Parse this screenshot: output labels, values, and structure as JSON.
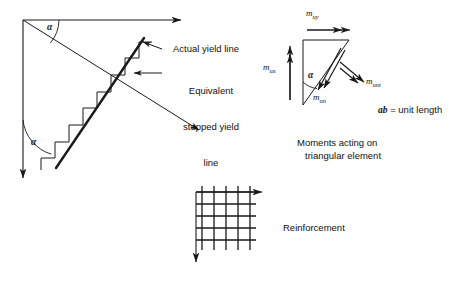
{
  "figure": {
    "background_color": "#ffffff",
    "line_color": "#1a1a1a"
  },
  "main_diagram": {
    "axes": [
      {
        "name": "x-axis",
        "label": "x",
        "direction": "right"
      },
      {
        "name": "y-axis",
        "label": "y",
        "direction": "down"
      },
      {
        "name": "n-axis",
        "label": "n",
        "direction": "down-right"
      },
      {
        "name": "t-axis",
        "label": "t",
        "direction": "down-left"
      }
    ],
    "angles": [
      {
        "name": "alpha-top",
        "label": "α",
        "between": "x-axis and n-axis"
      },
      {
        "name": "alpha-bottom",
        "label": "α",
        "between": "y-axis and t-axis"
      }
    ],
    "annotations": [
      {
        "name": "actual-yield-line",
        "text": "Actual yield line",
        "lines": [
          "Actual yield line"
        ]
      },
      {
        "name": "equivalent-stepped-yield-line",
        "text": "Equivalent stepped yield line",
        "lines": [
          "Equivalent",
          "stepped yield",
          "line"
        ]
      }
    ]
  },
  "moment_diagram": {
    "vertices": [
      {
        "name": "vertex-a",
        "label": "a"
      },
      {
        "name": "vertex-b",
        "label": "b"
      },
      {
        "name": "vertex-c",
        "label": "c"
      }
    ],
    "angle_label": "α",
    "moments": [
      {
        "name": "m-ux",
        "symbol": "m",
        "subscript": "ux",
        "direction": "up"
      },
      {
        "name": "m-uy",
        "symbol": "m",
        "subscript": "uy",
        "direction": "right"
      },
      {
        "name": "m-un",
        "symbol": "m",
        "subscript": "un",
        "direction": "down-right"
      },
      {
        "name": "m-unt",
        "symbol": "m",
        "subscript": "unt",
        "direction": "down-right"
      }
    ],
    "note": {
      "italic": "ab",
      "rest": " = unit length"
    },
    "caption_lines": [
      "Moments acting on",
      "triangular element"
    ]
  },
  "reinforcement_diagram": {
    "label": "Reinforcement",
    "axes": [
      {
        "name": "x-axis",
        "label": "x",
        "direction": "right"
      },
      {
        "name": "y-axis",
        "label": "y",
        "direction": "down"
      }
    ],
    "grid": {
      "columns": 5,
      "rows": 5
    }
  }
}
